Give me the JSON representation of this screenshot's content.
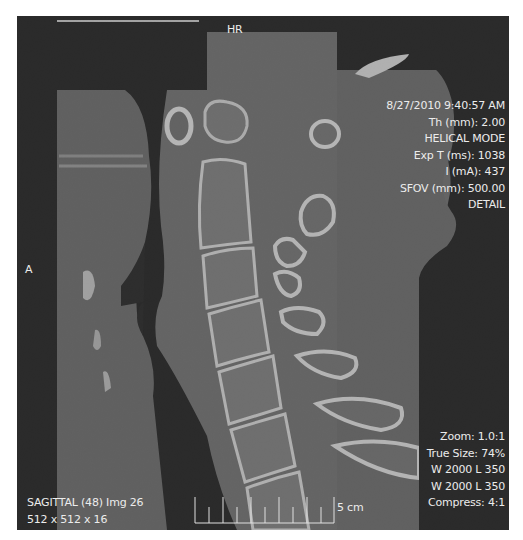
{
  "viewer": {
    "modality": "CT",
    "view_plane": "SAGITTAL"
  },
  "overlays": {
    "top_center": "HR",
    "orientation_left": "A",
    "top_right": [
      "8/27/2010 9:40:57 AM",
      "Th (mm):  2.00",
      "HELICAL MODE",
      "Exp T (ms):  1038",
      "I (mA):  437",
      "SFOV (mm):  500.00",
      "DETAIL"
    ],
    "bottom_right": [
      "Zoom:  1.0:1",
      "True Size:  74%",
      "W 2000  L 350",
      "W 2000  L 350",
      "Compress:  4:1"
    ],
    "bottom_left": [
      "SAGITTAL (48) Img 26",
      "512 x 512 x 16"
    ],
    "scale_bar": {
      "label": "5 cm",
      "ticks": 10
    }
  },
  "colors": {
    "background": "#030303",
    "soft_tissue": "#5a5a5a",
    "bone": "#d6d6d6",
    "text": "#ececec",
    "page": "#ffffff"
  }
}
